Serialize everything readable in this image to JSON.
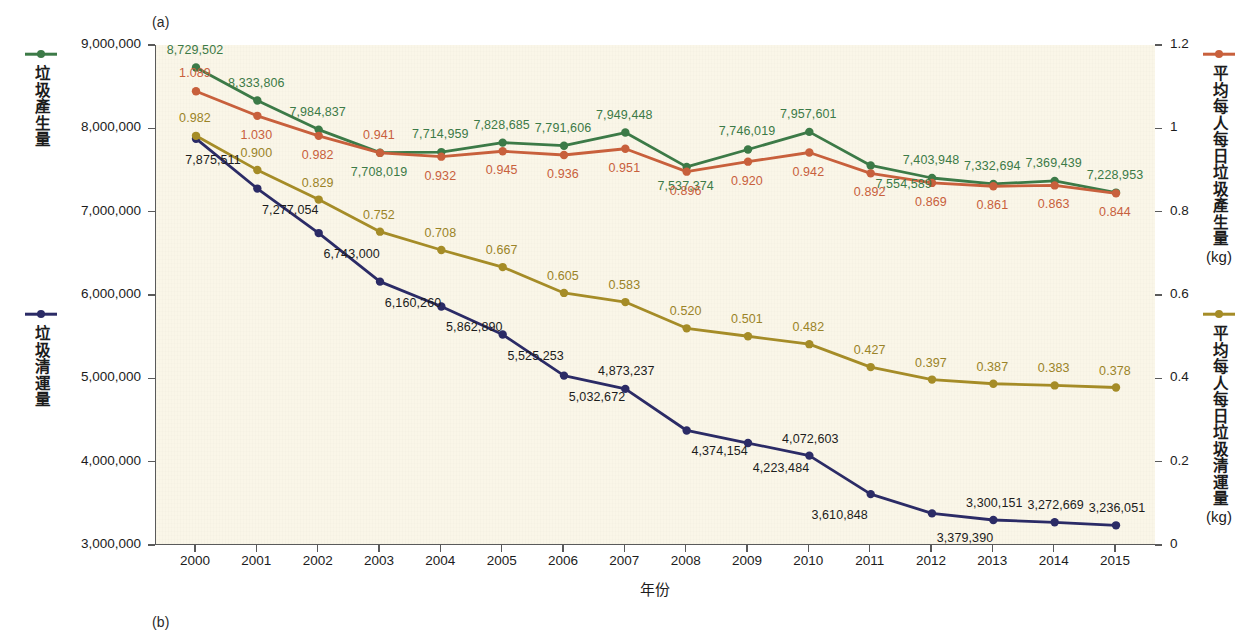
{
  "figure": {
    "panel_a_label": "(a)",
    "panel_b_label": "(b)",
    "x_axis_title": "年份",
    "background_color": "#faf6e8"
  },
  "legends": {
    "green": {
      "name": "垃圾產生量",
      "unit": "",
      "color": "#3c7a47"
    },
    "navy": {
      "name": "垃圾清運量",
      "unit": "",
      "color": "#2b2b66"
    },
    "orange": {
      "name": "平均每人每日垃圾產生量",
      "unit": "(kg)",
      "color": "#c8603c"
    },
    "olive": {
      "name": "平均每人每日垃圾清運量",
      "unit": "(kg)",
      "color": "#a58c27"
    }
  },
  "axes": {
    "y_left": {
      "ticks": [
        "3,000,000",
        "4,000,000",
        "5,000,000",
        "6,000,000",
        "7,000,000",
        "8,000,000",
        "9,000,000"
      ],
      "min": 3000000,
      "max": 9000000
    },
    "y_right": {
      "ticks": [
        "0",
        "0.2",
        "0.4",
        "0.6",
        "0.8",
        "1",
        "1.2"
      ],
      "min": 0,
      "max": 1.2
    },
    "x": {
      "ticks": [
        "2000",
        "2001",
        "2002",
        "2003",
        "2004",
        "2005",
        "2006",
        "2007",
        "2008",
        "2009",
        "2010",
        "2011",
        "2012",
        "2013",
        "2014",
        "2015"
      ]
    }
  },
  "chart_data": {
    "type": "line",
    "title": "",
    "xlabel": "年份",
    "ylabel": "垃圾產生量 / 垃圾清運量",
    "grid": false,
    "legend_position": "outside-left-and-right",
    "x": [
      2000,
      2001,
      2002,
      2003,
      2004,
      2005,
      2006,
      2007,
      2008,
      2009,
      2010,
      2011,
      2012,
      2013,
      2014,
      2015
    ],
    "categories": [
      "2000",
      "2001",
      "2002",
      "2003",
      "2004",
      "2005",
      "2006",
      "2007",
      "2008",
      "2009",
      "2010",
      "2011",
      "2012",
      "2013",
      "2014",
      "2015"
    ],
    "y_left_axis": {
      "label": "垃圾產生量 / 垃圾清運量 (公噸)",
      "min": 3000000,
      "max": 9000000,
      "ticks": [
        3000000,
        4000000,
        5000000,
        6000000,
        7000000,
        8000000,
        9000000
      ]
    },
    "y_right_axis": {
      "label": "平均每人每日垃圾產生量 / 清運量 (kg)",
      "min": 0,
      "max": 1.2,
      "ticks": [
        0,
        0.2,
        0.4,
        0.6,
        0.8,
        1,
        1.2
      ]
    },
    "series": [
      {
        "name": "垃圾產生量",
        "color": "#3c7a47",
        "axis": "left",
        "values": [
          8729502,
          8333806,
          7984837,
          7708019,
          7714959,
          7828685,
          7791606,
          7949448,
          7537374,
          7746019,
          7957601,
          7554589,
          7403948,
          7332694,
          7369439,
          7228953
        ],
        "labels": [
          "8,729,502",
          "8,333,806",
          "7,984,837",
          "7,708,019",
          "7,714,959",
          "7,828,685",
          "7,791,606",
          "7,949,448",
          "7,537,374",
          "7,746,019",
          "7,957,601",
          "7,554,589",
          "7,403,948",
          "7,332,694",
          "7,369,439",
          "7,228,953"
        ]
      },
      {
        "name": "垃圾清運量",
        "color": "#2b2b66",
        "axis": "left",
        "values": [
          7875511,
          7277054,
          6743000,
          6160260,
          5862890,
          5525253,
          5032672,
          4873237,
          4374154,
          4223484,
          4072603,
          3610848,
          3379390,
          3300151,
          3272669,
          3236051
        ],
        "labels": [
          "7,875,511",
          "7,277,054",
          "6,743,000",
          "6,160,260",
          "5,862,890",
          "5,525,253",
          "5,032,672",
          "4,873,237",
          "4,374,154",
          "4,223,484",
          "4,072,603",
          "3,610,848",
          "3,379,390",
          "3,300,151",
          "3,272,669",
          "3,236,051"
        ]
      },
      {
        "name": "平均每人每日垃圾產生量",
        "color": "#c8603c",
        "axis": "right",
        "values": [
          1.089,
          1.03,
          0.982,
          0.941,
          0.932,
          0.945,
          0.936,
          0.951,
          0.896,
          0.92,
          0.942,
          0.892,
          0.869,
          0.861,
          0.863,
          0.844
        ],
        "labels": [
          "1.089",
          "1.030",
          "0.982",
          "0.941",
          "0.932",
          "0.945",
          "0.936",
          "0.951",
          "0.896",
          "0.920",
          "0.942",
          "0.892",
          "0.869",
          "0.861",
          "0.863",
          "0.844"
        ]
      },
      {
        "name": "平均每人每日垃圾清運量",
        "color": "#a58c27",
        "axis": "right",
        "values": [
          0.982,
          0.9,
          0.829,
          0.752,
          0.708,
          0.667,
          0.605,
          0.583,
          0.52,
          0.501,
          0.482,
          0.427,
          0.397,
          0.387,
          0.383,
          0.378
        ],
        "labels": [
          "0.982",
          "0.900",
          "0.829",
          "0.752",
          "0.708",
          "0.667",
          "0.605",
          "0.583",
          "0.520",
          "0.501",
          "0.482",
          "0.427",
          "0.397",
          "0.387",
          "0.383",
          "0.378"
        ]
      }
    ]
  }
}
